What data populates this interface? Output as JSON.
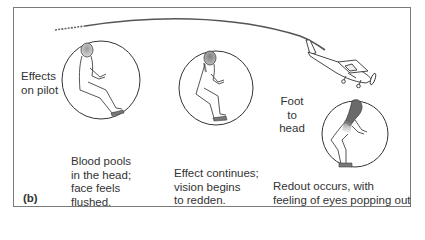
{
  "figure": {
    "panel_label": "(b)",
    "side_label": "Effects\non pilot",
    "direction_label": "Foot\nto\nhead",
    "stages": [
      {
        "caption": "Blood pools\nin the head;\nface feels\nflushed."
      },
      {
        "caption": "Effect continues;\nvision begins\nto redden."
      },
      {
        "caption": "Redout occurs, with\nfeeling of eyes popping out"
      }
    ],
    "colors": {
      "border": "#7a7a7a",
      "line": "#444444",
      "blood_shading": "#8a8a8a",
      "text": "#333333"
    }
  }
}
